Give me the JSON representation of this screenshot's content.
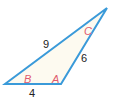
{
  "diagram": {
    "type": "triangle",
    "colors": {
      "stroke": "#3a9ad9",
      "fill": "#fdfaf0",
      "vertex_label": "#e05a6e",
      "side_label": "#222222"
    },
    "vertices": {
      "B": {
        "label": "B",
        "x": 5,
        "y": 84,
        "label_x": 24,
        "label_y": 83
      },
      "A": {
        "label": "A",
        "x": 61,
        "y": 84,
        "label_x": 52,
        "label_y": 83
      },
      "C": {
        "label": "C",
        "x": 107,
        "y": 8,
        "label_x": 84,
        "label_y": 35
      }
    },
    "sides": {
      "BC": {
        "label": "9",
        "x": 43,
        "y": 48
      },
      "AC": {
        "label": "6",
        "x": 81,
        "y": 62
      },
      "BA": {
        "label": "4",
        "x": 29,
        "y": 97
      }
    }
  }
}
